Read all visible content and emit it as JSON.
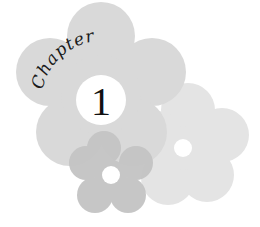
{
  "graphic": {
    "word": "Chapter",
    "number": "1"
  },
  "colors": {
    "big_flower": "#d9d9d9",
    "right_flower": "#e4e4e4",
    "small_flower": "#c2c2c2",
    "center": "#ffffff",
    "text": "#1a1a1a"
  }
}
